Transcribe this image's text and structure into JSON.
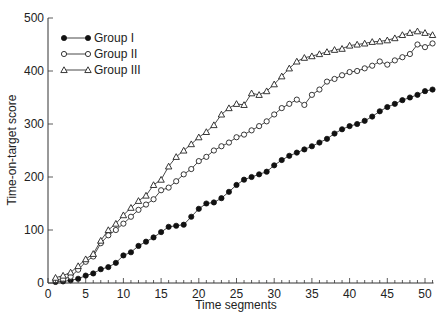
{
  "chart_data": {
    "type": "line",
    "title": "",
    "xlabel": "Time segments",
    "ylabel": "Time-on-target score",
    "xlim": [
      0,
      51
    ],
    "ylim": [
      0,
      500
    ],
    "xticks": [
      0,
      5,
      10,
      15,
      20,
      25,
      30,
      35,
      40,
      45,
      50
    ],
    "yticks": [
      0,
      100,
      200,
      300,
      400,
      500
    ],
    "grid": false,
    "legend_position": "upper-left",
    "x": [
      1,
      2,
      3,
      4,
      5,
      6,
      7,
      8,
      9,
      10,
      11,
      12,
      13,
      14,
      15,
      16,
      17,
      18,
      19,
      20,
      21,
      22,
      23,
      24,
      25,
      26,
      27,
      28,
      29,
      30,
      31,
      32,
      33,
      34,
      35,
      36,
      37,
      38,
      39,
      40,
      41,
      42,
      43,
      44,
      45,
      46,
      47,
      48,
      49,
      50,
      51
    ],
    "series": [
      {
        "name": "Group I",
        "marker": "filled-circle",
        "values": [
          2,
          3,
          5,
          8,
          14,
          18,
          26,
          30,
          38,
          52,
          58,
          70,
          78,
          86,
          96,
          106,
          108,
          110,
          125,
          140,
          150,
          152,
          160,
          172,
          185,
          195,
          200,
          205,
          210,
          222,
          232,
          240,
          246,
          252,
          258,
          265,
          272,
          282,
          290,
          296,
          300,
          306,
          314,
          324,
          332,
          338,
          345,
          350,
          355,
          362,
          365
        ]
      },
      {
        "name": "Group II",
        "marker": "open-circle",
        "values": [
          5,
          7,
          12,
          25,
          40,
          50,
          75,
          90,
          100,
          112,
          125,
          138,
          148,
          158,
          175,
          180,
          192,
          205,
          215,
          230,
          238,
          250,
          258,
          265,
          275,
          280,
          288,
          296,
          305,
          318,
          330,
          338,
          346,
          336,
          355,
          365,
          380,
          385,
          392,
          398,
          400,
          405,
          410,
          418,
          412,
          420,
          426,
          432,
          450,
          445,
          452
        ]
      },
      {
        "name": "Group III",
        "marker": "open-triangle",
        "values": [
          10,
          14,
          20,
          32,
          45,
          55,
          80,
          100,
          112,
          128,
          142,
          155,
          165,
          185,
          195,
          220,
          238,
          250,
          262,
          275,
          285,
          298,
          318,
          330,
          338,
          336,
          358,
          355,
          362,
          375,
          390,
          405,
          418,
          425,
          428,
          432,
          436,
          440,
          442,
          448,
          450,
          452,
          455,
          456,
          458,
          462,
          468,
          472,
          475,
          472,
          468
        ]
      }
    ]
  }
}
